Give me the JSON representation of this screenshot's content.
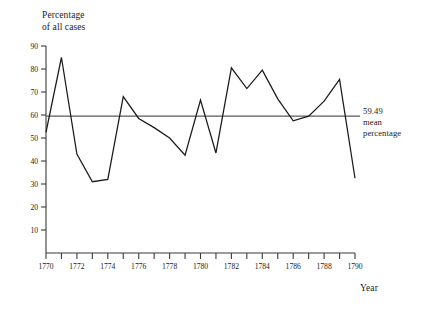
{
  "chart_data": {
    "type": "line",
    "title": "",
    "subtitle": "",
    "xlabel": "Year",
    "ylabel": "Percentage\nof all cases",
    "ylabel_lines": [
      "Percentage",
      "of all cases"
    ],
    "x": [
      1770,
      1771,
      1772,
      1773,
      1774,
      1775,
      1776,
      1777,
      1778,
      1779,
      1780,
      1781,
      1782,
      1783,
      1784,
      1785,
      1786,
      1787,
      1788,
      1789,
      1790
    ],
    "values": [
      52.5,
      85.0,
      43.0,
      31.0,
      32.0,
      68.0,
      58.5,
      54.5,
      50.0,
      42.5,
      66.5,
      43.5,
      80.5,
      71.5,
      79.5,
      67.0,
      57.5,
      59.5,
      66.0,
      75.5,
      32.5
    ],
    "series": [
      {
        "name": "Percentage of all cases",
        "values": [
          52.5,
          85.0,
          43.0,
          31.0,
          32.0,
          68.0,
          58.5,
          54.5,
          50.0,
          42.5,
          66.5,
          43.5,
          80.5,
          71.5,
          79.5,
          67.0,
          57.5,
          59.5,
          66.0,
          75.5,
          32.5
        ]
      }
    ],
    "xlim": [
      1770,
      1790
    ],
    "ylim": [
      0,
      90
    ],
    "ytick_values": [
      10,
      20,
      30,
      40,
      50,
      60,
      70,
      80,
      90
    ],
    "ytick_labels": [
      "10",
      "20",
      "30",
      "40",
      "50",
      "60",
      "70",
      "80",
      "90"
    ],
    "xtick_values": [
      1770,
      1771,
      1772,
      1773,
      1774,
      1775,
      1776,
      1777,
      1778,
      1779,
      1780,
      1781,
      1782,
      1783,
      1784,
      1785,
      1786,
      1787,
      1788,
      1789,
      1790
    ],
    "xtick_labels_shown": [
      "1770",
      "1772",
      "1774",
      "1776",
      "1778",
      "1780",
      "1782",
      "1784",
      "1786",
      "1788",
      "1790"
    ],
    "xtick_labels_shown_values": [
      1770,
      1772,
      1774,
      1776,
      1778,
      1780,
      1782,
      1784,
      1786,
      1788,
      1790
    ],
    "grid": false,
    "legend": "none",
    "reference_line": {
      "value": 59.49,
      "label_lines": [
        "59.49",
        "mean",
        "percentage"
      ],
      "label_value": "59.49",
      "label_text_line2": "mean",
      "label_text_line3": "percentage"
    },
    "colors": {
      "line": "#1a1a1a",
      "axis": "#3a3a3a",
      "mean_line": "#5a5a5a",
      "background": "#ffffff"
    }
  }
}
